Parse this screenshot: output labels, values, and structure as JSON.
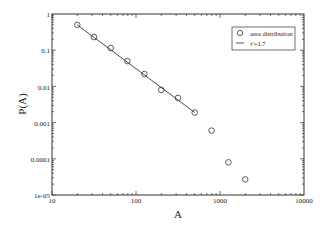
{
  "chart_data": {
    "type": "scatter",
    "title": "",
    "xlabel": "A",
    "ylabel": "P(A)",
    "xscale": "log",
    "yscale": "log",
    "xlim": [
      10,
      10000
    ],
    "ylim": [
      1e-05,
      1
    ],
    "x_ticks": [
      "10",
      "100",
      "1000",
      "10000"
    ],
    "y_ticks": [
      "1e-05",
      "0.0001",
      "0.001",
      "0.01",
      "0.1",
      "1"
    ],
    "grid": false,
    "legend_position": "upper right",
    "series": [
      {
        "name": "area distribution",
        "marker": "open-circle",
        "x": [
          20,
          31.6,
          50,
          79,
          126,
          200,
          316,
          500,
          794,
          1259,
          1995
        ],
        "y": [
          0.5,
          0.23,
          0.115,
          0.05,
          0.022,
          0.008,
          0.0048,
          0.0019,
          0.0006,
          8e-05,
          2.7e-05
        ]
      },
      {
        "name": "τ'=1.7",
        "style": "line",
        "x": [
          20,
          500
        ],
        "y": [
          0.5,
          0.0019
        ]
      }
    ]
  },
  "labels": {
    "xlabel": "A",
    "ylabel": "P(A)",
    "legend_item_1": "area distribution",
    "legend_item_2": "τ'=1.7",
    "xtick_0": "10",
    "xtick_1": "100",
    "xtick_2": "1000",
    "xtick_3": "10000",
    "ytick_0": "1e-05",
    "ytick_1": "0.0001",
    "ytick_2": "0.001",
    "ytick_3": "0.01",
    "ytick_4": "0.1",
    "ytick_5": "1"
  }
}
